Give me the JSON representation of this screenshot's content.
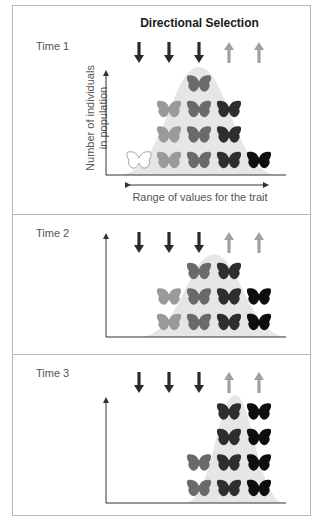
{
  "title": "Directional Selection",
  "colors": {
    "down_arrow": "#2a2a2a",
    "up_arrow": "#a0a0a0",
    "curve_fill": "#e6e6e6",
    "shade_white": "#ffffff",
    "shade_light": "#9a9a9a",
    "shade_mid": "#6a6a6a",
    "shade_dark": "#2e2e2e",
    "shade_black": "#0e0e0e",
    "axis": "#333333",
    "frame": "#b8b8b8"
  },
  "axes": {
    "y_label_line1": "Number of individuals",
    "y_label_line2": "in population",
    "x_label": "Range of values for the trait"
  },
  "arrows": [
    {
      "direction": "down",
      "icon": "down-arrow-icon"
    },
    {
      "direction": "down",
      "icon": "down-arrow-icon"
    },
    {
      "direction": "down",
      "icon": "down-arrow-icon"
    },
    {
      "direction": "up",
      "icon": "up-arrow-icon"
    },
    {
      "direction": "up",
      "icon": "up-arrow-icon"
    }
  ],
  "panels": [
    {
      "label": "Time 1",
      "counts_by_trait_class": [
        1,
        3,
        4,
        3,
        1
      ],
      "shades_by_trait_class": [
        "white",
        "light",
        "mid",
        "dark",
        "black"
      ]
    },
    {
      "label": "Time 2",
      "counts_by_trait_class": [
        0,
        2,
        3,
        3,
        2
      ],
      "shades_by_trait_class": [
        "white",
        "light",
        "mid",
        "dark",
        "black"
      ]
    },
    {
      "label": "Time 3",
      "counts_by_trait_class": [
        0,
        0,
        2,
        4,
        4
      ],
      "shades_by_trait_class": [
        "white",
        "light",
        "mid",
        "dark",
        "black"
      ]
    }
  ]
}
